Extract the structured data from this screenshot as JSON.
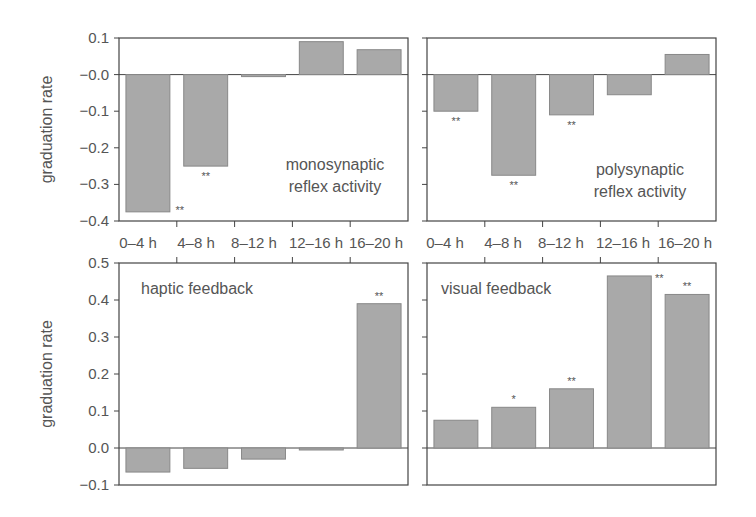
{
  "chart_data": [
    {
      "type": "bar",
      "title": "monosynaptic reflex activity",
      "panel_label_lines": [
        "monosynaptic",
        "reflex activity"
      ],
      "categories": [
        "0–4 h",
        "4–8 h",
        "8–12 h",
        "12–16 h",
        "16–20 h"
      ],
      "values": [
        -0.375,
        -0.25,
        -0.005,
        0.09,
        0.068
      ],
      "significance": [
        "**",
        "**",
        "",
        "",
        ""
      ],
      "xlabel": "",
      "ylabel": "graduation rate",
      "ylim": [
        -0.4,
        0.1
      ],
      "yticks": [
        0.1,
        0.0,
        -0.1,
        -0.2,
        -0.3,
        -0.4
      ],
      "ytick_labels": [
        "0.1",
        "−0.0",
        "−0.1",
        "−0.2",
        "−0.3",
        "−0.4"
      ],
      "grid": false
    },
    {
      "type": "bar",
      "title": "polysynaptic reflex activity",
      "panel_label_lines": [
        "polysynaptic",
        "reflex activity"
      ],
      "categories": [
        "0–4 h",
        "4–8 h",
        "8–12 h",
        "12–16 h",
        "16–20 h"
      ],
      "values": [
        -0.1,
        -0.275,
        -0.11,
        -0.055,
        0.055
      ],
      "significance": [
        "**",
        "**",
        "**",
        "",
        ""
      ],
      "xlabel": "",
      "ylabel": "",
      "ylim": [
        -0.4,
        0.1
      ],
      "grid": false
    },
    {
      "type": "bar",
      "title": "haptic feedback",
      "panel_label_lines": [
        "haptic feedback"
      ],
      "categories": [
        "0–4 h",
        "4–8 h",
        "8–12 h",
        "12–16 h",
        "16–20 h"
      ],
      "values": [
        -0.065,
        -0.055,
        -0.03,
        -0.005,
        0.39
      ],
      "significance": [
        "",
        "",
        "",
        "",
        "**"
      ],
      "xlabel": "",
      "ylabel": "graduation rate",
      "ylim": [
        -0.1,
        0.5
      ],
      "yticks": [
        0.5,
        0.4,
        0.3,
        0.2,
        0.1,
        0.0,
        -0.1
      ],
      "ytick_labels": [
        "0.5",
        "0.4",
        "0.3",
        "0.2",
        "0.1",
        "0.0",
        "−0.1"
      ],
      "grid": false
    },
    {
      "type": "bar",
      "title": "visual feedback",
      "panel_label_lines": [
        "visual feedback"
      ],
      "categories": [
        "0–4 h",
        "4–8 h",
        "8–12 h",
        "12–16 h",
        "16–20 h"
      ],
      "values": [
        0.075,
        0.11,
        0.16,
        0.465,
        0.415
      ],
      "significance": [
        "",
        "*",
        "**",
        "**",
        "**"
      ],
      "xlabel": "",
      "ylabel": "",
      "ylim": [
        -0.1,
        0.5
      ],
      "grid": false
    }
  ],
  "x_tick_labels": [
    "0–4 h",
    "4–8 h",
    "8–12 h",
    "12–16 h",
    "16–20 h"
  ],
  "colors": {
    "bar_fill": "#a9a9a9",
    "bar_stroke": "#888888",
    "axis": "#444444",
    "text": "#555555"
  }
}
